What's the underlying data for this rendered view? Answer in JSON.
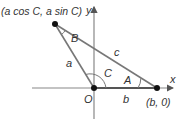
{
  "diagram": {
    "vertex_top_label": "(a cos C, a sin C)",
    "vertex_right_label": "(b, 0)",
    "origin_label": "O",
    "axis_x_label": "x",
    "axis_y_label": "y",
    "side_a": "a",
    "side_b": "b",
    "side_c": "c",
    "angle_A": "A",
    "angle_B": "B",
    "angle_C": "C"
  },
  "colors": {
    "axis": "#888888",
    "triangle": "#777777",
    "point": "#111111",
    "text": "#333333"
  }
}
